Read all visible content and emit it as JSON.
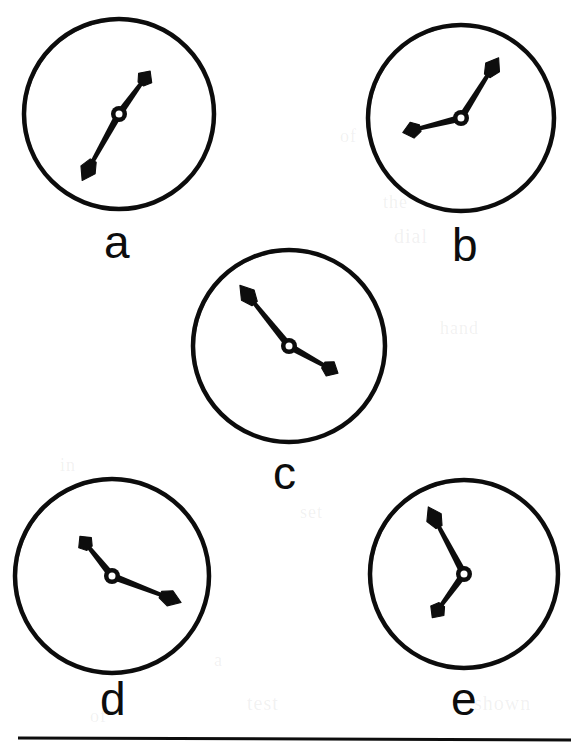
{
  "figure": {
    "name": "clock-faces-figure",
    "background_color": "#ffffff",
    "ink_color": "#0d0d0d",
    "width": 581,
    "height": 753,
    "caption_rule": {
      "name": "horizontal-rule",
      "x1": 18,
      "y1": 738,
      "x2": 571,
      "y2": 740,
      "thickness": 3
    }
  },
  "clocks": [
    {
      "id": "a",
      "label": "a",
      "label_x": 104,
      "label_y": 219,
      "center_x": 119,
      "center_y": 114,
      "radius": 95,
      "rim_thickness": 4.5,
      "hub_outer_radius": 8,
      "hub_inner_radius": 3.5,
      "hands": [
        {
          "role": "minute-hand",
          "angle_deg": 209,
          "length": 76,
          "width": 6.5,
          "tip_x": 55,
          "tip_y": 152,
          "clock_position": "toward 7"
        },
        {
          "role": "hour-hand",
          "angle_deg": 36,
          "length": 53,
          "width": 6.5,
          "tip_x": 150,
          "tip_y": 74,
          "clock_position": "toward 1"
        }
      ]
    },
    {
      "id": "b",
      "label": "b",
      "label_x": 452,
      "label_y": 222,
      "center_x": 461,
      "center_y": 118,
      "radius": 93,
      "rim_thickness": 4.5,
      "hub_outer_radius": 8,
      "hub_inner_radius": 3.5,
      "hands": [
        {
          "role": "minute-hand",
          "angle_deg": 32,
          "length": 71,
          "width": 6.5,
          "tip_x": 498,
          "tip_y": 58,
          "clock_position": "toward 1"
        },
        {
          "role": "hour-hand",
          "angle_deg": 256,
          "length": 60,
          "width": 6.5,
          "tip_x": 403,
          "tip_y": 132,
          "clock_position": "toward 8"
        }
      ]
    },
    {
      "id": "c",
      "label": "c",
      "label_x": 273,
      "label_y": 450,
      "center_x": 289,
      "center_y": 346,
      "radius": 96,
      "rim_thickness": 4.5,
      "hub_outer_radius": 8,
      "hub_inner_radius": 3.5,
      "hands": [
        {
          "role": "minute-hand",
          "angle_deg": 321,
          "length": 78,
          "width": 6.5,
          "tip_x": 240,
          "tip_y": 288,
          "clock_position": "toward 10-11"
        },
        {
          "role": "hour-hand",
          "angle_deg": 119,
          "length": 56,
          "width": 6.5,
          "tip_x": 337,
          "tip_y": 375,
          "clock_position": "toward 4"
        }
      ]
    },
    {
      "id": "d",
      "label": "d",
      "label_x": 100,
      "label_y": 676,
      "center_x": 112,
      "center_y": 576,
      "radius": 97,
      "rim_thickness": 4.5,
      "hub_outer_radius": 8,
      "hub_inner_radius": 3.5,
      "hands": [
        {
          "role": "minute-hand",
          "angle_deg": 111,
          "length": 74,
          "width": 6.5,
          "tip_x": 181,
          "tip_y": 603,
          "clock_position": "toward 3-4"
        },
        {
          "role": "hour-hand",
          "angle_deg": 321,
          "length": 51,
          "width": 6.5,
          "tip_x": 80,
          "tip_y": 537,
          "clock_position": "toward 10-11"
        }
      ]
    },
    {
      "id": "e",
      "label": "e",
      "label_x": 451,
      "label_y": 676,
      "center_x": 464,
      "center_y": 574,
      "radius": 94,
      "rim_thickness": 4.5,
      "hub_outer_radius": 8,
      "hub_inner_radius": 3.5,
      "hands": [
        {
          "role": "minute-hand",
          "angle_deg": 332,
          "length": 76,
          "width": 6.5,
          "tip_x": 428,
          "tip_y": 508,
          "clock_position": "toward 11"
        },
        {
          "role": "hour-hand",
          "angle_deg": 216,
          "length": 54,
          "width": 6.5,
          "tip_x": 431,
          "tip_y": 617,
          "clock_position": "toward 7"
        }
      ]
    }
  ],
  "scan_ghosts": [
    {
      "text": "of",
      "x": 340,
      "y": 126,
      "size": 18
    },
    {
      "text": "the",
      "x": 383,
      "y": 192,
      "size": 18
    },
    {
      "text": "dial",
      "x": 394,
      "y": 225,
      "size": 20
    },
    {
      "text": "in",
      "x": 60,
      "y": 455,
      "size": 18
    },
    {
      "text": "hand",
      "x": 440,
      "y": 318,
      "size": 18
    },
    {
      "text": "time",
      "x": 35,
      "y": 510,
      "size": 18
    },
    {
      "text": "set",
      "x": 300,
      "y": 502,
      "size": 18
    },
    {
      "text": "a",
      "x": 214,
      "y": 650,
      "size": 18
    },
    {
      "text": "test",
      "x": 247,
      "y": 692,
      "size": 20
    },
    {
      "text": "shown",
      "x": 474,
      "y": 692,
      "size": 20
    },
    {
      "text": "of",
      "x": 90,
      "y": 706,
      "size": 18
    }
  ]
}
